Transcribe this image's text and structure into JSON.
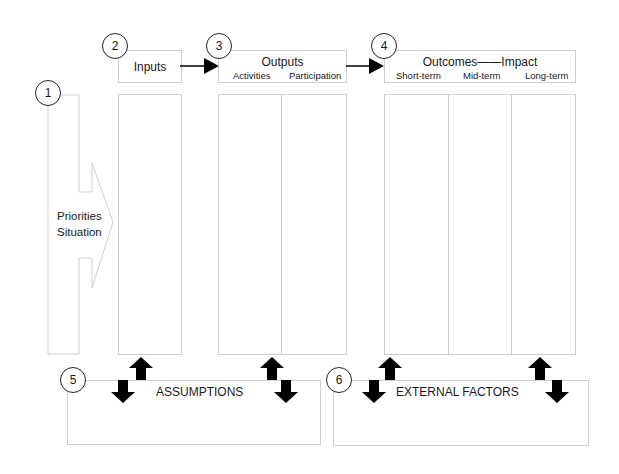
{
  "diagram": {
    "type": "logic-model",
    "steps": [
      {
        "number": "1",
        "label_line1": "Priorities",
        "label_line2": "Situation"
      },
      {
        "number": "2",
        "label": "Inputs"
      },
      {
        "number": "3",
        "label": "Outputs",
        "columns": [
          "Activities",
          "Participation"
        ]
      },
      {
        "number": "4",
        "label": "Outcomes——Impact",
        "columns": [
          "Short-term",
          "Mid-term",
          "Long-term"
        ]
      },
      {
        "number": "5",
        "label": "ASSUMPTIONS"
      },
      {
        "number": "6",
        "label": "EXTERNAL FACTORS"
      }
    ],
    "icons": {
      "flow_arrow": "right-arrow-icon",
      "bidirectional": "up-down-arrows-icon"
    },
    "colors": {
      "box_border": "#cfcfcf",
      "arrow": "#000000",
      "text": "#1a1a1a"
    }
  }
}
